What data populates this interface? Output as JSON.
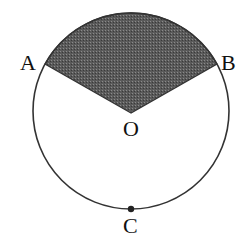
{
  "diagram": {
    "type": "circle-sector",
    "colors": {
      "stroke": "#333333",
      "shade": "#555555",
      "background": "#ffffff"
    },
    "circle": {
      "cx": 131,
      "cy": 111,
      "r": 98
    },
    "points": {
      "A": {
        "label": "A",
        "x": 46,
        "y": 64
      },
      "B": {
        "label": "B",
        "x": 216,
        "y": 64
      },
      "O": {
        "label": "O",
        "x": 131,
        "y": 113
      },
      "C": {
        "label": "C",
        "x": 131,
        "y": 209
      }
    },
    "shaded_region": "sector AOB (minor arc above)"
  }
}
